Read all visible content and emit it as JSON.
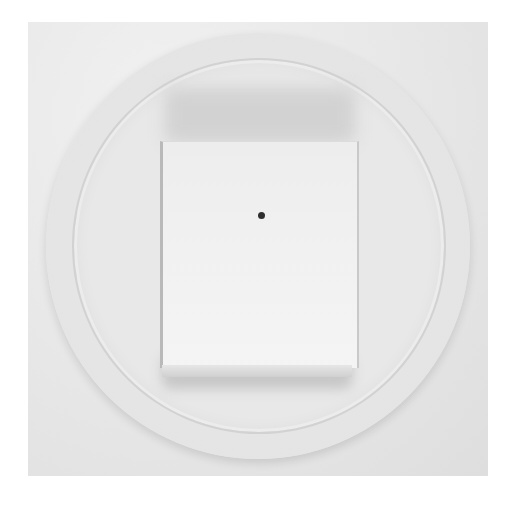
{
  "image": {
    "subject": "petri dish with white square sample",
    "description": "Grayscale photograph of a round petri dish containing a rectangular white sample with a small dark dot near its center",
    "colors": {
      "background": "#e6e6e6",
      "dish_rim": "#bdbdbd",
      "sample": "#f1f1f1",
      "dot": "#2e2e2e"
    }
  }
}
